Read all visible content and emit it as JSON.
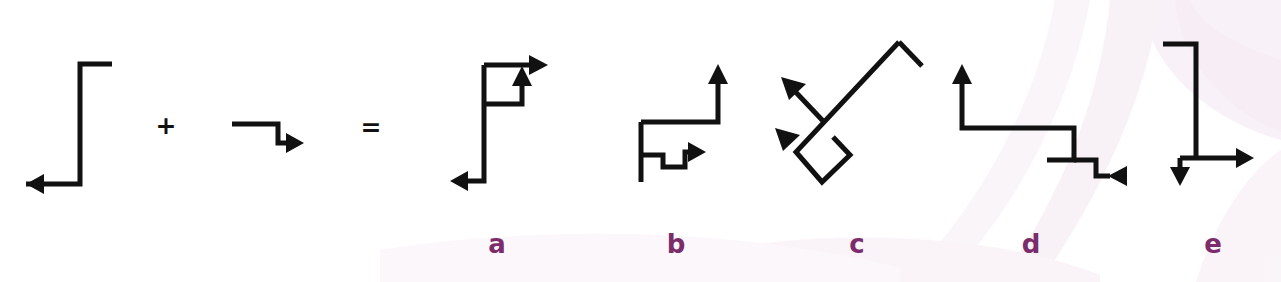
{
  "figure": {
    "background_color": "#ffffff",
    "stroke_color": "#111111",
    "label_color": "#7b2d6b",
    "watermark_color": "#f0e3ef",
    "operators": [
      {
        "name": "plus",
        "symbol": "+",
        "x": 166,
        "y": 134
      },
      {
        "name": "equals",
        "symbol": "=",
        "x": 371,
        "y": 136
      }
    ],
    "panel_labels": [
      {
        "id": "a",
        "text": "a",
        "x": 497,
        "y": 253
      },
      {
        "id": "b",
        "text": "b",
        "x": 676,
        "y": 253
      },
      {
        "id": "c",
        "text": "c",
        "x": 857,
        "y": 253
      },
      {
        "id": "d",
        "text": "d",
        "x": 1031,
        "y": 253
      },
      {
        "id": "e",
        "text": "e",
        "x": 1213,
        "y": 253
      }
    ],
    "operand_left": {
      "name": "operand-shape-1",
      "description": "Z shaped polyline with left arrowhead at bottom",
      "path": "M 112 64 L 80 64 L 80 184 L 26 184",
      "arrowheads": [
        {
          "name": "arrow-left",
          "points": "26,184 44,174 44,194"
        }
      ]
    },
    "operand_right": {
      "name": "operand-shape-2",
      "description": "Step down polyline with right arrowhead",
      "path": "M 232 124 L 278 124 L 278 143 L 292 143",
      "arrowheads": [
        {
          "name": "arrow-right",
          "points": "304,143 286,133 286,153"
        }
      ]
    },
    "results": [
      {
        "id": "a",
        "name": "result-shape-a",
        "description": "Tall vertical with top-right arrow, inner box with up arrow, bottom left arrow",
        "paths": [
          "M 484 65 L 536 65",
          "M 484 65 L 484 181 L 462 181",
          "M 484 104 L 522 104 L 522 80"
        ],
        "arrowheads": [
          {
            "name": "arrow-right-top",
            "points": "548,65 529,55 529,75"
          },
          {
            "name": "arrow-up-inner",
            "points": "522,66 512,86 532,86"
          },
          {
            "name": "arrow-left-bottom",
            "points": "450,181 468,171 468,191"
          }
        ]
      },
      {
        "id": "b",
        "name": "result-shape-b",
        "description": "Vertical stem, horizontal arm rising to up arrow, inner zigzag with right arrow",
        "paths": [
          "M 641 122 L 718 122 L 718 76",
          "M 641 122 L 641 182",
          "M 641 155 L 663 155 L 663 167 L 685 167 L 685 152 L 694 152"
        ],
        "arrowheads": [
          {
            "name": "arrow-up",
            "points": "718,64 708,84 728,84"
          },
          {
            "name": "arrow-right-inner",
            "points": "706,152 688,142 688,162"
          }
        ]
      },
      {
        "id": "c",
        "name": "result-shape-c",
        "description": "Rotated version of shape a, two arrows pointing up-left",
        "paths": [
          "M 899 42 L 922 66",
          "M 899 42 L 796 152 L 822 182 L 850 155 L 833 137",
          "M 824 122 L 789 85"
        ],
        "arrowheads": [
          {
            "name": "arrow-upleft-outer",
            "points": "781,77 806,84 789,100"
          },
          {
            "name": "arrow-upleft-inner",
            "points": "775,128 800,135 783,151"
          }
        ]
      },
      {
        "id": "d",
        "name": "result-shape-d",
        "description": "Up arrow, descending steps, terminal left-pointing arrowhead",
        "paths": [
          "M 962 78 L 962 128 L 1074 128 L 1074 160 L 1047 160",
          "M 1074 160 L 1096 160 L 1096 176 L 1110 176"
        ],
        "arrowheads": [
          {
            "name": "arrow-up",
            "points": "962,64 952,84 972,84"
          },
          {
            "name": "arrow-left-terminal",
            "points": "1108,176 1127,166 1127,186"
          }
        ]
      },
      {
        "id": "e",
        "name": "result-shape-e",
        "description": "Top hook, long vertical, cross bar with right arrow and short down arrow",
        "paths": [
          "M 1163 44 L 1196 44 L 1196 158",
          "M 1180 158 L 1242 158",
          "M 1180 158 L 1180 172"
        ],
        "arrowheads": [
          {
            "name": "arrow-right",
            "points": "1254,158 1236,148 1236,168"
          },
          {
            "name": "arrow-down",
            "points": "1180,186 1170,167 1190,167"
          }
        ]
      }
    ]
  }
}
